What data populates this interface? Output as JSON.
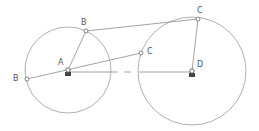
{
  "diagram": {
    "type": "four-bar linkage",
    "colors": {
      "line": "#8a8a8a",
      "circle": "#9a9a9a",
      "label": "#555555",
      "pivot_fill": "#444444"
    },
    "circles": [
      {
        "id": "circle-A",
        "cx": 68,
        "cy": 70,
        "r": 43
      },
      {
        "id": "circle-D",
        "cx": 192,
        "cy": 71,
        "r": 54
      }
    ],
    "points": {
      "A": {
        "x": 68,
        "y": 70
      },
      "B_top": {
        "x": 86,
        "y": 31
      },
      "B_left": {
        "x": 27,
        "y": 79
      },
      "C_top": {
        "x": 198,
        "y": 19
      },
      "C_mid": {
        "x": 141,
        "y": 53
      },
      "D": {
        "x": 192,
        "y": 71
      }
    },
    "labels": [
      {
        "id": "label-A",
        "text": "A",
        "x": 58,
        "y": 59
      },
      {
        "id": "label-B-top",
        "text": "B",
        "x": 81,
        "y": 19
      },
      {
        "id": "label-B-left",
        "text": "B",
        "x": 13,
        "y": 75
      },
      {
        "id": "label-C-top",
        "text": "C",
        "x": 197,
        "y": 7
      },
      {
        "id": "label-C-mid",
        "text": "C",
        "x": 147,
        "y": 48
      },
      {
        "id": "label-D",
        "text": "D",
        "x": 197,
        "y": 61
      }
    ]
  }
}
